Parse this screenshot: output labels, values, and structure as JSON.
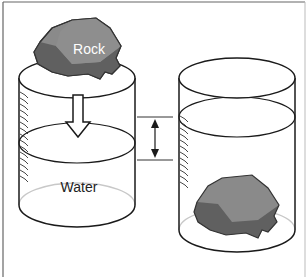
{
  "diagram": {
    "labels": {
      "rock": "Rock",
      "water": "Water"
    },
    "colors": {
      "frame": "#555555",
      "outline": "#1a1a1a",
      "rock_light": "#8a8a8a",
      "rock_dark": "#5e5e5e",
      "rock_outline": "#333333",
      "back_rim": "#c8c8c8",
      "label_on_rock": "#ffffff",
      "label_text": "#222222"
    },
    "left_cylinder": {
      "state": "before",
      "contains": "water",
      "rock_position": "resting on top rim",
      "arrow": "down (rock about to be dropped)"
    },
    "right_cylinder": {
      "state": "after",
      "contains": "water",
      "rock_position": "submerged at bottom"
    },
    "measurement": {
      "type": "double-headed arrow",
      "meaning": "rise in water level"
    }
  }
}
